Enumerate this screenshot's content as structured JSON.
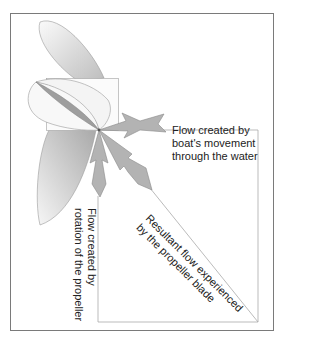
{
  "diagram": {
    "labels": {
      "boat_flow": [
        "Flow created by",
        "boat's movement",
        "through the water"
      ],
      "rotation_flow": [
        "Flow created by",
        "rotation of the propeller"
      ],
      "resultant_flow": [
        "Resultant flow experienced",
        "by the propeller blade"
      ]
    },
    "colors": {
      "frame": "#777777",
      "arrow_fill": "#b0b0b0",
      "arrow_stroke": "#8a8a8a",
      "blade_light": "#f2f2f2",
      "blade_dark": "#c8c8c8",
      "guide_line": "#aaaaaa",
      "text": "#222222"
    }
  }
}
